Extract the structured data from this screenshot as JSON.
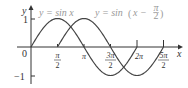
{
  "chart_data": {
    "type": "line",
    "title": "",
    "xlabel": "x",
    "ylabel": "y",
    "xlim": [
      0,
      7.85
    ],
    "ylim": [
      -1,
      1
    ],
    "x_ticks": [
      "0",
      "π/2",
      "π",
      "3π/2",
      "2π",
      "5π/2"
    ],
    "y_ticks": [
      "1",
      "-1"
    ],
    "series": [
      {
        "name": "y = sin x",
        "function": "sin(x)",
        "domain": [
          0,
          6.283
        ],
        "color": "#444444"
      },
      {
        "name": "y = sin (x − π/2)",
        "function": "sin(x - pi/2)",
        "domain": [
          1.571,
          7.854
        ],
        "color": "#444444"
      }
    ],
    "legend": [
      "y = sin x",
      "y = sin (x − π/2)"
    ],
    "grid": false
  },
  "labels": {
    "y_axis": "y",
    "x_axis": "x",
    "origin": "0",
    "y_one": "1",
    "y_neg_one": "−1",
    "pi_num": "π",
    "two": "2",
    "pi": "π",
    "three_pi": "3π",
    "two_pi": "2π",
    "five_pi": "5π",
    "legend1": "y = sin x",
    "legend2_prefix": "y = sin",
    "legend2_inner": "x −"
  }
}
